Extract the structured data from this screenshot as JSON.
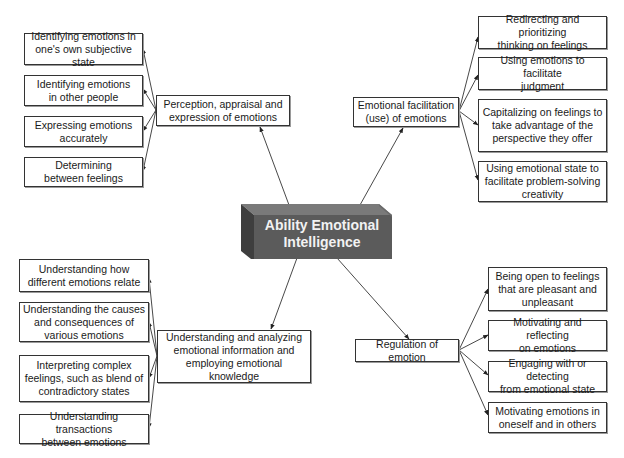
{
  "center": {
    "label": "Ability Emotional\nIntelligence",
    "color_front": "#5b5b5b",
    "color_side": "#3f3f3f",
    "color_top": "#777777"
  },
  "branches": [
    {
      "id": "perception",
      "label": "Perception, appraisal and\nexpression of emotions",
      "children": [
        "Identifying emotions in\none's own subjective state",
        "Identifying emotions\nin other people",
        "Expressing emotions\naccurately",
        "Determining\nbetween feelings"
      ]
    },
    {
      "id": "facilitation",
      "label": "Emotional facilitation\n(use) of emotions",
      "children": [
        "Redirecting and prioritizing\nthinking on feelings",
        "Using emotions to facilitate\njudgment",
        "Capitalizing on feelings to\ntake advantage of the\nperspective they offer",
        "Using emotional state to\nfacilitate problem-solving\ncreativity"
      ]
    },
    {
      "id": "understanding",
      "label": "Understanding and analyzing\nemotional information and\nemploying emotional knowledge",
      "children": [
        "Understanding how\ndifferent emotions relate",
        "Understanding the causes\nand consequences of\nvarious emotions",
        "Interpreting complex\nfeelings, such as blend of\ncontradictory states",
        "Understanding transactions\nbetween emotions"
      ]
    },
    {
      "id": "regulation",
      "label": "Regulation of emotion",
      "children": [
        "Being open to feelings\nthat are pleasant and\nunpleasant",
        "Motivating and reflecting\non emotions",
        "Engaging with or detecting\nfrom emotional state",
        "Motivating emotions in\noneself and in others"
      ]
    }
  ]
}
